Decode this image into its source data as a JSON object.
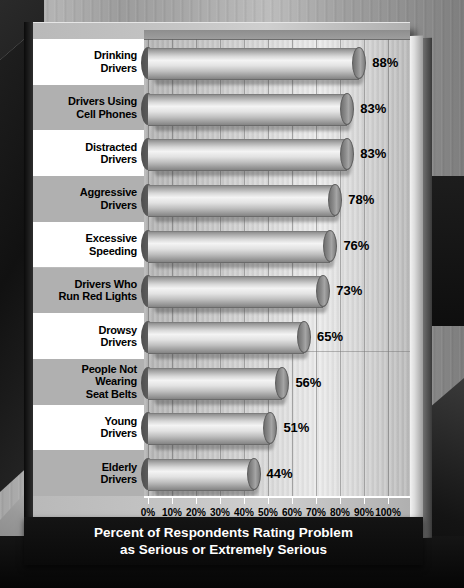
{
  "chart_data": {
    "type": "bar",
    "orientation": "horizontal",
    "title": "Percent of Respondents Rating Problem as Serious or Extremely Serious",
    "title_line1": "Percent of Respondents Rating Problem",
    "title_line2": "as Serious or Extremely Serious",
    "xlabel": "",
    "ylabel": "",
    "xlim": [
      0,
      100
    ],
    "grid": true,
    "legend": "none",
    "categories": [
      "Drinking Drivers",
      "Drivers Using Cell Phones",
      "Distracted Drivers",
      "Aggressive Drivers",
      "Excessive Speeding",
      "Drivers Who Run Red Lights",
      "Drowsy Drivers",
      "People Not Wearing Seat Belts",
      "Young Drivers",
      "Elderly Drivers"
    ],
    "values": [
      88,
      83,
      83,
      78,
      76,
      73,
      65,
      56,
      51,
      44
    ],
    "value_labels": [
      "88%",
      "83%",
      "83%",
      "78%",
      "76%",
      "73%",
      "65%",
      "56%",
      "51%",
      "44%"
    ],
    "xticks": [
      0,
      10,
      20,
      30,
      40,
      50,
      60,
      70,
      80,
      90,
      100
    ],
    "xtick_labels": [
      "0%",
      "10%",
      "20%",
      "30%",
      "40%",
      "50%",
      "60%",
      "70%",
      "80%",
      "90%",
      "100%"
    ]
  },
  "categories_wrapped": [
    [
      "Drinking",
      "Drivers"
    ],
    [
      "Drivers Using",
      "Cell Phones"
    ],
    [
      "Distracted",
      "Drivers"
    ],
    [
      "Aggressive",
      "Drivers"
    ],
    [
      "Excessive",
      "Speeding"
    ],
    [
      "Drivers Who",
      "Run Red Lights"
    ],
    [
      "Drowsy",
      "Drivers"
    ],
    [
      "People Not",
      "Wearing",
      "Seat Belts"
    ],
    [
      "Young",
      "Drivers"
    ],
    [
      "Elderly",
      "Drivers"
    ]
  ],
  "colors": {
    "label_band_light": "#ffffff",
    "label_band_gray": "#b0b0b0",
    "title_background": "#0a0a0a",
    "title_text": "#ffffff",
    "axis_line": "#ffffff",
    "text": "#000000",
    "bar_highlight": "#f4f4f4",
    "bar_shade": "#848484",
    "bar_cap": "#8a8a8a"
  }
}
